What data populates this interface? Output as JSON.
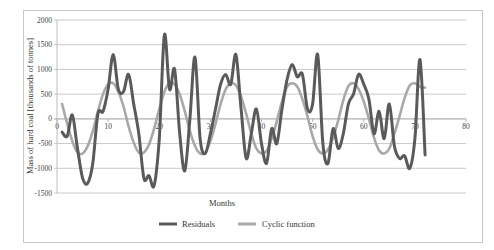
{
  "chart_data": {
    "type": "line",
    "title": "",
    "xlabel": "Months",
    "ylabel": "Mass of hard coal [thousands of tonnes]",
    "xlim": [
      0,
      80
    ],
    "ylim": [
      -1500,
      2000
    ],
    "x_ticks": [
      0,
      10,
      20,
      30,
      40,
      50,
      60,
      70,
      80
    ],
    "y_ticks": [
      2000,
      1500,
      1000,
      500,
      0,
      -500,
      -1000,
      -1500
    ],
    "grid": "horizontal",
    "legend_position": "bottom",
    "series": [
      {
        "name": "Residuals",
        "color": "#5a5a5a",
        "x": [
          1,
          2,
          3,
          4,
          5,
          6,
          7,
          8,
          9,
          10,
          11,
          12,
          13,
          14,
          15,
          16,
          17,
          18,
          19,
          20,
          21,
          22,
          23,
          24,
          25,
          26,
          27,
          28,
          29,
          30,
          31,
          32,
          33,
          34,
          35,
          36,
          37,
          38,
          39,
          40,
          41,
          42,
          43,
          44,
          45,
          46,
          47,
          48,
          49,
          50,
          51,
          52,
          53,
          54,
          55,
          56,
          57,
          58,
          59,
          60,
          61,
          62,
          63,
          64,
          65,
          66,
          67,
          68,
          69,
          70,
          71,
          72
        ],
        "values": [
          -270,
          -350,
          80,
          -600,
          -1200,
          -1300,
          -900,
          100,
          150,
          600,
          1300,
          600,
          550,
          900,
          300,
          -300,
          -1200,
          -1150,
          -1350,
          -400,
          1700,
          600,
          1000,
          -300,
          -1050,
          0,
          1250,
          -400,
          -700,
          -300,
          200,
          700,
          900,
          700,
          1300,
          200,
          -800,
          -300,
          200,
          -500,
          -900,
          -200,
          -500,
          200,
          800,
          1100,
          850,
          900,
          200,
          300,
          1300,
          -500,
          -900,
          -200,
          -600,
          -300,
          300,
          500,
          900,
          700,
          400,
          -300,
          150,
          -400,
          300,
          -550,
          -800,
          -750,
          -1000,
          -400,
          1200,
          -730
        ]
      },
      {
        "name": "Cyclic function",
        "color": "#a8a8a8",
        "x": [
          1,
          2,
          3,
          4,
          5,
          6,
          7,
          8,
          9,
          10,
          11,
          12,
          13,
          14,
          15,
          16,
          17,
          18,
          19,
          20,
          21,
          22,
          23,
          24,
          25,
          26,
          27,
          28,
          29,
          30,
          31,
          32,
          33,
          34,
          35,
          36,
          37,
          38,
          39,
          40,
          41,
          42,
          43,
          44,
          45,
          46,
          47,
          48,
          49,
          50,
          51,
          52,
          53,
          54,
          55,
          56,
          57,
          58,
          59,
          60,
          61,
          62,
          63,
          64,
          65,
          66,
          67,
          68,
          69,
          70,
          71,
          72
        ],
        "values": [
          300,
          -100,
          -450,
          -680,
          -700,
          -550,
          -250,
          150,
          500,
          700,
          720,
          550,
          250,
          -150,
          -480,
          -680,
          -680,
          -520,
          -200,
          200,
          550,
          720,
          700,
          500,
          150,
          -250,
          -550,
          -700,
          -680,
          -450,
          -100,
          300,
          600,
          720,
          680,
          450,
          100,
          -300,
          -600,
          -700,
          -650,
          -400,
          -50,
          350,
          650,
          720,
          650,
          400,
          50,
          -350,
          -620,
          -700,
          -620,
          -380,
          -30,
          380,
          660,
          720,
          600,
          350,
          0,
          -380,
          -640,
          -700,
          -600,
          -300,
          50,
          420,
          680,
          720,
          650,
          630
        ]
      }
    ]
  },
  "legend": {
    "residuals_label": "Residuals",
    "cyclic_label": "Cyclic function"
  }
}
